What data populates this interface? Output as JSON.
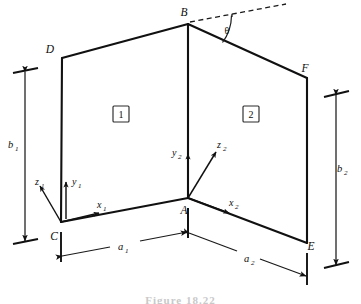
{
  "figure": {
    "type": "engineering-diagram",
    "caption": "Figure   18.22"
  },
  "vertices": [
    {
      "id": "B",
      "label": "B",
      "x": 188,
      "y": 24,
      "label_x": 184,
      "label_y": 16
    },
    {
      "id": "D",
      "label": "D",
      "x": 62,
      "y": 58,
      "label_x": 50,
      "label_y": 53
    },
    {
      "id": "F",
      "label": "F",
      "x": 307,
      "y": 78,
      "label_x": 305,
      "label_y": 72
    },
    {
      "id": "C",
      "label": "C",
      "x": 61,
      "y": 222,
      "label_x": 54,
      "label_y": 240
    },
    {
      "id": "A",
      "label": "A",
      "x": 188,
      "y": 198,
      "label_x": 184,
      "label_y": 214
    },
    {
      "id": "E",
      "label": "E",
      "x": 307,
      "y": 243,
      "label_x": 311,
      "label_y": 250
    }
  ],
  "panels": [
    {
      "id": "panel-1",
      "label": "1",
      "x": 121,
      "y": 114
    },
    {
      "id": "panel-2",
      "label": "2",
      "x": 251,
      "y": 114
    }
  ],
  "angle": {
    "label": "θ",
    "name": "theta",
    "label_x": 227,
    "label_y": 34,
    "description": "angle between the dashed horizontal reference line at B and edge BF"
  },
  "axes": [
    {
      "origin": "C",
      "name": "coordinate-system-1",
      "arrows": [
        {
          "id": "x1",
          "label": "x",
          "sub": "1",
          "label_x": 97,
          "label_y": 208
        },
        {
          "id": "y1",
          "label": "y",
          "sub": "1",
          "label_x": 72,
          "label_y": 185
        },
        {
          "id": "z1",
          "label": "z",
          "sub": "1",
          "label_x": 35,
          "label_y": 185
        }
      ]
    },
    {
      "origin": "A",
      "name": "coordinate-system-2",
      "arrows": [
        {
          "id": "x2",
          "label": "x",
          "sub": "2",
          "label_x": 229,
          "label_y": 206
        },
        {
          "id": "y2",
          "label": "y",
          "sub": "2",
          "label_x": 172,
          "label_y": 156
        },
        {
          "id": "z2",
          "label": "z",
          "sub": "2",
          "label_x": 217,
          "label_y": 148
        }
      ]
    }
  ],
  "dimensions": [
    {
      "id": "b1",
      "label": "b",
      "sub": "1",
      "label_x": 12,
      "label_y": 148,
      "orientation": "vertical",
      "side": "left",
      "description": "height of panel 1 (edge DC)"
    },
    {
      "id": "b2",
      "label": "b",
      "sub": "2",
      "label_x": 341,
      "label_y": 172,
      "orientation": "vertical",
      "side": "right",
      "description": "height of panel 2 (edge FE)"
    },
    {
      "id": "a1",
      "label": "a",
      "sub": "1",
      "label_x": 121,
      "label_y": 250,
      "orientation": "inclined",
      "side": "bottom",
      "description": "width of panel 1 (edge CA)"
    },
    {
      "id": "a2",
      "label": "a",
      "sub": "2",
      "label_x": 247,
      "label_y": 262,
      "orientation": "inclined",
      "side": "bottom",
      "description": "width of panel 2 (edge AE)"
    }
  ]
}
